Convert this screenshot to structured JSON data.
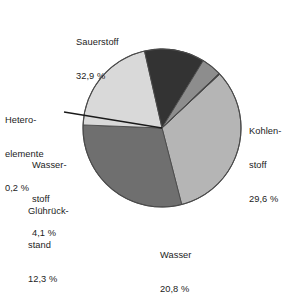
{
  "chart_data": {
    "type": "pie",
    "title": "",
    "subtitle": "",
    "xlabel": "",
    "ylabel": "",
    "legend_position": "none",
    "grid": false,
    "units": "%",
    "decimal_separator": ",",
    "total": 99.9,
    "start_angle_deg": -43,
    "direction": "clockwise",
    "categories": [
      "Sauerstoff",
      "Kohlenstoff",
      "Wasser",
      "Glührückstand",
      "Wasserstoff",
      "Heteroelemente"
    ],
    "values": [
      32.9,
      29.6,
      20.8,
      12.3,
      4.1,
      0.2
    ],
    "slices": [
      {
        "name": "Sauerstoff",
        "label_line1": "Sauerstoff",
        "label_line2": "32,9 %",
        "value": 32.9,
        "value_text": "32,9 %",
        "color": "#b5b5b5"
      },
      {
        "name": "Kohlenstoff",
        "label_line1": "Kohlen-",
        "label_line2": "stoff",
        "label_line3": "29,6 %",
        "value": 29.6,
        "value_text": "29,6 %",
        "color": "#6f6f6f"
      },
      {
        "name": "Wasser",
        "label_line1": "Wasser",
        "label_line2": "20,8 %",
        "value": 20.8,
        "value_text": "20,8 %",
        "color": "#d9d9d9"
      },
      {
        "name": "Glührückstand",
        "label_line1": "Glührück-",
        "label_line2": "stand",
        "label_line3": "12,3 %",
        "value": 12.3,
        "value_text": "12,3 %",
        "color": "#333333"
      },
      {
        "name": "Wasserstoff",
        "label_line1": "Wasser-",
        "label_line2": "stoff",
        "label_line3": "4,1 %",
        "value": 4.1,
        "value_text": "4,1 %",
        "color": "#8d8d8d"
      },
      {
        "name": "Heteroelemente",
        "label_line1": "Hetero-",
        "label_line2": "elemente",
        "label_line3": "0,2 %",
        "value": 0.2,
        "value_text": "0,2 %",
        "color": "#2a2a2a",
        "has_leader_line": true
      }
    ]
  },
  "labels": {
    "sauerstoff": {
      "name": "Sauerstoff",
      "value": "32,9 %"
    },
    "kohlenstoff": {
      "line1": "Kohlen-",
      "line2": "stoff",
      "value": "29,6 %"
    },
    "wasser": {
      "name": "Wasser",
      "value": "20,8 %"
    },
    "gluehrueckstand": {
      "line1": "Glührück-",
      "line2": "stand",
      "value": "12,3 %"
    },
    "wasserstoff": {
      "line1": "Wasser-",
      "line2": "stoff",
      "value": "4,1 %"
    },
    "heteroelemente": {
      "line1": "Hetero-",
      "line2": "elemente",
      "value": "0,2 %"
    }
  },
  "colors": {
    "background": "#ffffff",
    "text": "#1c1c1c",
    "outline": "#4a4a4a",
    "leader_line": "#1a1a1a"
  }
}
